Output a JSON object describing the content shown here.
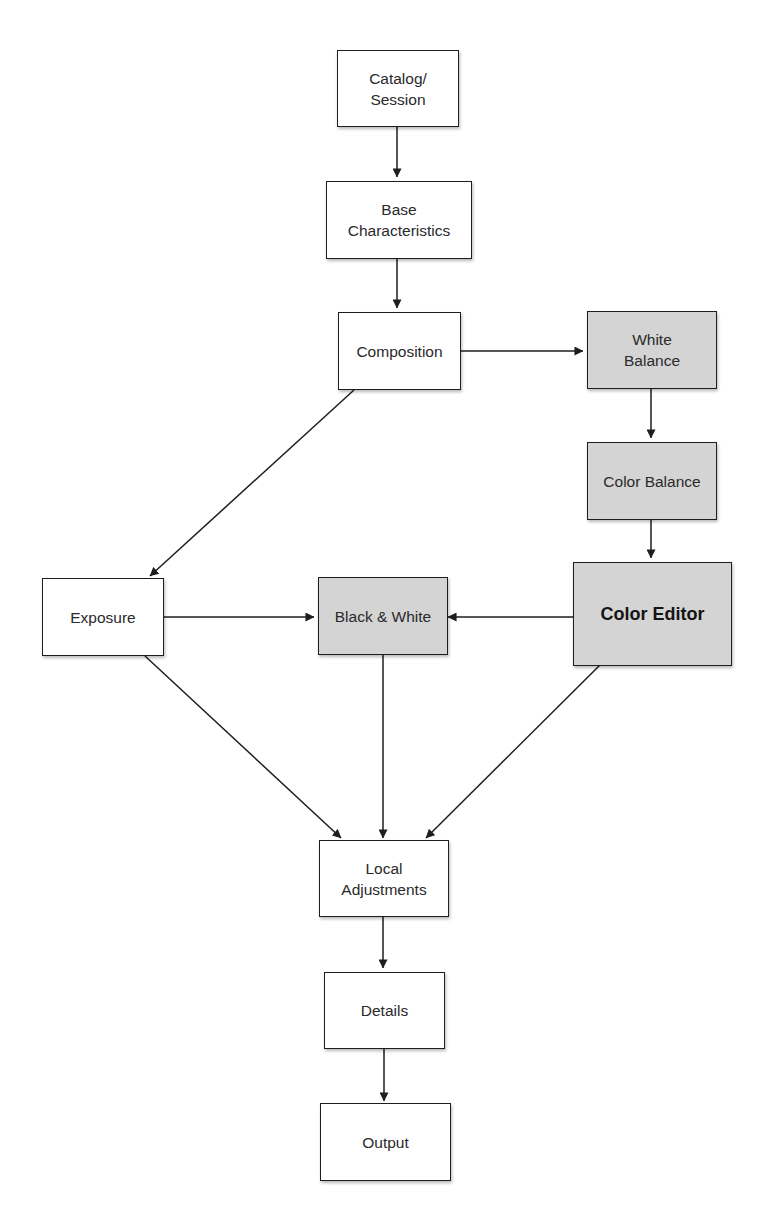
{
  "diagram": {
    "type": "flowchart",
    "colors": {
      "node_fill": "#ffffff",
      "shaded_fill": "#d4d4d4",
      "border": "#1e1e1e",
      "edge": "#1e1e1e",
      "text": "#2a2a2a"
    },
    "nodes": [
      {
        "id": "catalog_session",
        "label": "Catalog/\nSession",
        "shaded": false
      },
      {
        "id": "base_characteristics",
        "label": "Base\nCharacteristics",
        "shaded": false
      },
      {
        "id": "composition",
        "label": "Composition",
        "shaded": false
      },
      {
        "id": "white_balance",
        "label": "White\nBalance",
        "shaded": true
      },
      {
        "id": "color_balance",
        "label": "Color Balance",
        "shaded": true
      },
      {
        "id": "color_editor",
        "label": "Color Editor",
        "shaded": true,
        "emphasized": true
      },
      {
        "id": "exposure",
        "label": "Exposure",
        "shaded": false
      },
      {
        "id": "black_white",
        "label": "Black & White",
        "shaded": true
      },
      {
        "id": "local_adjustments",
        "label": "Local\nAdjustments",
        "shaded": false
      },
      {
        "id": "details",
        "label": "Details",
        "shaded": false
      },
      {
        "id": "output",
        "label": "Output",
        "shaded": false
      }
    ],
    "edges": [
      {
        "from": "catalog_session",
        "to": "base_characteristics"
      },
      {
        "from": "base_characteristics",
        "to": "composition"
      },
      {
        "from": "composition",
        "to": "white_balance"
      },
      {
        "from": "composition",
        "to": "exposure"
      },
      {
        "from": "white_balance",
        "to": "color_balance"
      },
      {
        "from": "color_balance",
        "to": "color_editor"
      },
      {
        "from": "color_editor",
        "to": "black_white"
      },
      {
        "from": "exposure",
        "to": "black_white"
      },
      {
        "from": "exposure",
        "to": "local_adjustments"
      },
      {
        "from": "black_white",
        "to": "local_adjustments"
      },
      {
        "from": "color_editor",
        "to": "local_adjustments"
      },
      {
        "from": "local_adjustments",
        "to": "details"
      },
      {
        "from": "details",
        "to": "output"
      }
    ]
  }
}
